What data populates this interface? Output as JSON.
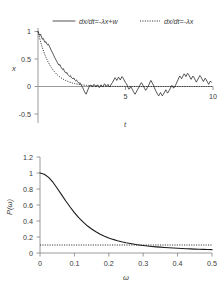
{
  "chart_data": [
    {
      "type": "line",
      "id": "time-series",
      "title": "",
      "xlabel": "t",
      "ylabel": "x",
      "xlim": [
        0,
        10
      ],
      "ylim": [
        -0.5,
        1.15
      ],
      "xticks": [
        0,
        5,
        10
      ],
      "xticklabels": [
        "",
        "5",
        "10"
      ],
      "yticks": [
        -0.5,
        0,
        0.5,
        1
      ],
      "yticklabels": [
        "-0.5",
        "0",
        "0.5",
        "1"
      ],
      "grid": false,
      "legend_position": "top",
      "legend": [
        {
          "label": "dx/dt=-λx+w",
          "style": "solid"
        },
        {
          "label": "dx/dt=-λx",
          "style": "dotted"
        }
      ],
      "series": [
        {
          "name": "dx/dt=-λx+w",
          "style": "solid",
          "x": [
            0,
            0.05,
            0.1,
            0.15,
            0.2,
            0.25,
            0.3,
            0.35,
            0.4,
            0.45,
            0.5,
            0.55,
            0.6,
            0.65,
            0.7,
            0.75,
            0.8,
            0.85,
            0.9,
            0.95,
            1,
            1.05,
            1.1,
            1.15,
            1.2,
            1.25,
            1.3,
            1.35,
            1.4,
            1.45,
            1.5,
            1.55,
            1.6,
            1.65,
            1.7,
            1.75,
            1.8,
            1.85,
            1.9,
            1.95,
            2,
            2.05,
            2.1,
            2.15,
            2.2,
            2.25,
            2.3,
            2.35,
            2.4,
            2.45,
            2.5,
            2.55,
            2.6,
            2.65,
            2.7,
            2.75,
            2.8,
            2.85,
            2.9,
            2.95,
            3,
            3.05,
            3.1,
            3.15,
            3.2,
            3.25,
            3.3,
            3.35,
            3.4,
            3.45,
            3.5,
            3.55,
            3.6,
            3.65,
            3.7,
            3.75,
            3.8,
            3.85,
            3.9,
            3.95,
            4,
            4.05,
            4.1,
            4.15,
            4.2,
            4.25,
            4.3,
            4.35,
            4.4,
            4.45,
            4.5,
            4.55,
            4.6,
            4.65,
            4.7,
            4.75,
            4.8,
            4.85,
            4.9,
            4.95,
            5,
            5.05,
            5.1,
            5.15,
            5.2,
            5.25,
            5.3,
            5.35,
            5.4,
            5.45,
            5.5,
            5.55,
            5.6,
            5.65,
            5.7,
            5.75,
            5.8,
            5.85,
            5.9,
            5.95,
            6,
            6.05,
            6.1,
            6.15,
            6.2,
            6.25,
            6.3,
            6.35,
            6.4,
            6.45,
            6.5,
            6.55,
            6.6,
            6.65,
            6.7,
            6.75,
            6.8,
            6.85,
            6.9,
            6.95,
            7,
            7.05,
            7.1,
            7.15,
            7.2,
            7.25,
            7.3,
            7.35,
            7.4,
            7.45,
            7.5,
            7.55,
            7.6,
            7.65,
            7.7,
            7.75,
            7.8,
            7.85,
            7.9,
            7.95,
            8,
            8.05,
            8.1,
            8.15,
            8.2,
            8.25,
            8.3,
            8.35,
            8.4,
            8.45,
            8.5,
            8.55,
            8.6,
            8.65,
            8.7,
            8.75,
            8.8,
            8.85,
            8.9,
            8.95,
            9,
            9.05,
            9.1,
            9.15,
            9.2,
            9.25,
            9.3,
            9.35,
            9.4,
            9.45,
            9.5,
            9.55,
            9.6,
            9.65,
            9.7,
            9.75,
            9.8,
            9.85,
            9.9,
            9.95,
            10
          ],
          "y": [
            1.0,
            0.965,
            0.93,
            0.95,
            0.9,
            0.86,
            0.875,
            0.83,
            0.8,
            0.815,
            0.78,
            0.755,
            0.77,
            0.73,
            0.7,
            0.66,
            0.63,
            0.6,
            0.565,
            0.53,
            0.5,
            0.47,
            0.44,
            0.41,
            0.385,
            0.4,
            0.36,
            0.335,
            0.31,
            0.325,
            0.285,
            0.26,
            0.24,
            0.255,
            0.215,
            0.2,
            0.185,
            0.2,
            0.165,
            0.15,
            0.14,
            0.155,
            0.12,
            0.105,
            0.12,
            0.09,
            0.07,
            0.055,
            0.07,
            0.03,
            0.01,
            -0.02,
            -0.05,
            -0.09,
            -0.12,
            -0.14,
            -0.1,
            -0.06,
            -0.02,
            0.01,
            0.03,
            0.01,
            -0.01,
            0.02,
            0.04,
            0.02,
            -0.01,
            0.01,
            0.03,
            0.0,
            -0.02,
            0.0,
            0.03,
            0.01,
            -0.01,
            0.02,
            0.05,
            0.03,
            0.0,
            0.02,
            0.04,
            0.01,
            -0.01,
            0.02,
            0.05,
            0.07,
            0.1,
            0.13,
            0.16,
            0.14,
            0.11,
            0.14,
            0.17,
            0.15,
            0.12,
            0.15,
            0.18,
            0.16,
            0.13,
            0.1,
            0.07,
            0.05,
            0.02,
            -0.02,
            -0.05,
            -0.03,
            0.0,
            -0.03,
            -0.06,
            -0.09,
            -0.12,
            -0.14,
            -0.11,
            -0.08,
            -0.05,
            -0.02,
            0.01,
            0.04,
            0.07,
            0.05,
            0.02,
            -0.01,
            -0.04,
            -0.07,
            -0.05,
            -0.02,
            0.01,
            0.04,
            0.08,
            0.11,
            0.08,
            0.05,
            0.02,
            -0.02,
            -0.06,
            -0.09,
            -0.12,
            -0.15,
            -0.17,
            -0.14,
            -0.11,
            -0.14,
            -0.17,
            -0.15,
            -0.12,
            -0.09,
            -0.06,
            -0.09,
            -0.12,
            -0.1,
            -0.07,
            -0.04,
            -0.01,
            0.02,
            0.0,
            -0.03,
            -0.01,
            0.02,
            0.05,
            0.09,
            0.12,
            0.16,
            0.19,
            0.17,
            0.14,
            0.17,
            0.2,
            0.23,
            0.21,
            0.18,
            0.21,
            0.24,
            0.22,
            0.19,
            0.16,
            0.13,
            0.16,
            0.19,
            0.17,
            0.14,
            0.11,
            0.08,
            0.11,
            0.14,
            0.17,
            0.2,
            0.18,
            0.15,
            0.12,
            0.09,
            0.12,
            0.15,
            0.13,
            0.1,
            0.07,
            0.04,
            0.07,
            0.1,
            0.08
          ]
        },
        {
          "name": "dx/dt=-λx",
          "style": "dotted",
          "lambda": 1.4,
          "x0": 1.0
        }
      ]
    },
    {
      "type": "line",
      "id": "power-spectrum",
      "title": "",
      "xlabel": "ω",
      "ylabel": "P(ω)",
      "xlim": [
        0,
        0.5
      ],
      "ylim": [
        0,
        1.2
      ],
      "xticks": [
        0,
        0.1,
        0.2,
        0.3,
        0.4,
        0.5
      ],
      "xticklabels": [
        "0",
        "0.1",
        "0.2",
        "0.3",
        "0.4",
        "0.5"
      ],
      "yticks": [
        0,
        0.2,
        0.4,
        0.6,
        0.8,
        1,
        1.2
      ],
      "yticklabels": [
        "0",
        "0.2",
        "0.4",
        "0.6",
        "0.8",
        "1",
        "1.2"
      ],
      "grid": false,
      "series": [
        {
          "name": "P(ω)",
          "style": "solid",
          "x": [
            0,
            0.0125,
            0.025,
            0.0375,
            0.05,
            0.0625,
            0.075,
            0.0875,
            0.1,
            0.1125,
            0.125,
            0.1375,
            0.15,
            0.1625,
            0.175,
            0.1875,
            0.2,
            0.2125,
            0.225,
            0.2375,
            0.25,
            0.2625,
            0.275,
            0.2875,
            0.3,
            0.3125,
            0.325,
            0.3375,
            0.35,
            0.3625,
            0.375,
            0.3875,
            0.4,
            0.4125,
            0.425,
            0.4375,
            0.45,
            0.4625,
            0.475,
            0.4875,
            0.5
          ],
          "y": [
            1.0,
            0.985,
            0.945,
            0.885,
            0.81,
            0.73,
            0.65,
            0.575,
            0.505,
            0.443,
            0.388,
            0.34,
            0.3,
            0.265,
            0.235,
            0.21,
            0.188,
            0.17,
            0.154,
            0.14,
            0.128,
            0.118,
            0.109,
            0.101,
            0.094,
            0.088,
            0.082,
            0.077,
            0.073,
            0.069,
            0.065,
            0.062,
            0.059,
            0.056,
            0.054,
            0.051,
            0.049,
            0.047,
            0.045,
            0.044,
            0.042
          ]
        },
        {
          "name": "threshold",
          "style": "dotted",
          "type": "hline",
          "value": 0.1
        }
      ]
    }
  ]
}
